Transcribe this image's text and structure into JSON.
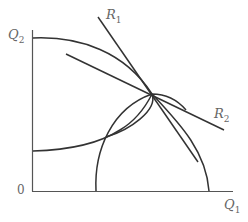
{
  "diagram": {
    "labels": {
      "y_axis": {
        "main": "Q",
        "sub": "2"
      },
      "x_axis": {
        "main": "Q",
        "sub": "1"
      },
      "origin": "0",
      "ray1": {
        "main": "R",
        "sub": "1"
      },
      "ray2": {
        "main": "R",
        "sub": "2"
      }
    },
    "colors": {
      "line": "#333333",
      "axis": "#555555",
      "label": "#666666"
    }
  }
}
